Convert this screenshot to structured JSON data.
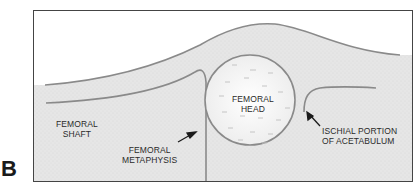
{
  "figure": {
    "panel_letter": "B",
    "colors": {
      "frame": "#444444",
      "outline": "#8a8a8a",
      "tissue_fill": "#e4e4e4",
      "head_fill": "#f4f4f4",
      "text": "#2a2a2a",
      "arrow": "#1a1a1a"
    },
    "labels": {
      "femoral_shaft": {
        "line1": "FEMORAL",
        "line2": "SHAFT"
      },
      "femoral_head": {
        "line1": "FEMORAL",
        "line2": "HEAD"
      },
      "femoral_metaphysis": {
        "line1": "FEMORAL",
        "line2": "METAPHYSIS"
      },
      "ischial_portion": {
        "line1": "ISCHIAL PORTION",
        "line2": "OF ACETABULUM"
      }
    }
  }
}
